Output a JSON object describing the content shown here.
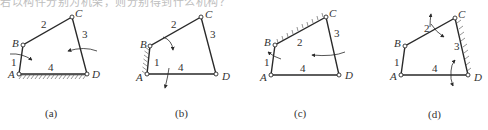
{
  "page": {
    "top_clipped_text": "若以构件分别为机架，则分别得到什么机构？"
  },
  "figures": [
    {
      "caption": "(a)",
      "fixed_link": "4",
      "joints": {
        "A": "A",
        "B": "B",
        "C": "C",
        "D": "D"
      },
      "links": {
        "l1": "1",
        "l2": "2",
        "l3": "3",
        "l4": "4"
      }
    },
    {
      "caption": "(b)",
      "fixed_link": "1",
      "joints": {
        "A": "A",
        "B": "B",
        "C": "C",
        "D": "D"
      },
      "links": {
        "l1": "1",
        "l2": "2",
        "l3": "3",
        "l4": "4"
      }
    },
    {
      "caption": "(c)",
      "fixed_link": "2",
      "joints": {
        "A": "A",
        "B": "B",
        "C": "C",
        "D": "D"
      },
      "links": {
        "l1": "1",
        "l2": "2",
        "l3": "3",
        "l4": "4"
      }
    },
    {
      "caption": "(d)",
      "fixed_link": "3",
      "joints": {
        "A": "A",
        "B": "B",
        "C": "C",
        "D": "D"
      },
      "links": {
        "l1": "1",
        "l2": "2",
        "l3": "3",
        "l4": "4"
      }
    }
  ]
}
